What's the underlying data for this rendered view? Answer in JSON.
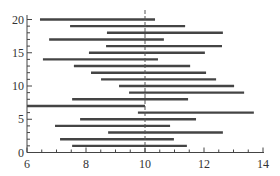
{
  "chart_data": {
    "type": "interval",
    "title": "",
    "xlabel": "",
    "ylabel": "",
    "xlim": [
      6,
      14
    ],
    "ylim": [
      0,
      20
    ],
    "x_ticks": [
      6,
      8,
      10,
      12,
      14
    ],
    "y_ticks": [
      0,
      5,
      10,
      15,
      20
    ],
    "reference_line": {
      "x": 10,
      "style": "dashed"
    },
    "grid": false,
    "series": [
      {
        "name": "intervals",
        "color": "#444444",
        "values": [
          {
            "y": 1,
            "lo": 7.53,
            "hi": 11.42
          },
          {
            "y": 2,
            "lo": 7.12,
            "hi": 10.98
          },
          {
            "y": 3,
            "lo": 8.75,
            "hi": 12.64
          },
          {
            "y": 4,
            "lo": 6.95,
            "hi": 10.85
          },
          {
            "y": 5,
            "lo": 7.8,
            "hi": 11.73
          },
          {
            "y": 6,
            "lo": 9.76,
            "hi": 13.69
          },
          {
            "y": 7,
            "lo": 6.0,
            "hi": 10.0
          },
          {
            "y": 8,
            "lo": 7.53,
            "hi": 11.46
          },
          {
            "y": 9,
            "lo": 9.46,
            "hi": 13.36
          },
          {
            "y": 10,
            "lo": 9.12,
            "hi": 13.02
          },
          {
            "y": 11,
            "lo": 8.51,
            "hi": 12.41
          },
          {
            "y": 12,
            "lo": 8.17,
            "hi": 12.07
          },
          {
            "y": 13,
            "lo": 7.59,
            "hi": 11.53
          },
          {
            "y": 14,
            "lo": 6.54,
            "hi": 10.44
          },
          {
            "y": 15,
            "lo": 8.1,
            "hi": 12.03
          },
          {
            "y": 16,
            "lo": 8.68,
            "hi": 12.61
          },
          {
            "y": 17,
            "lo": 6.75,
            "hi": 10.64
          },
          {
            "y": 18,
            "lo": 8.71,
            "hi": 12.64
          },
          {
            "y": 19,
            "lo": 7.46,
            "hi": 11.36
          },
          {
            "y": 20,
            "lo": 6.44,
            "hi": 10.34
          }
        ]
      }
    ]
  }
}
